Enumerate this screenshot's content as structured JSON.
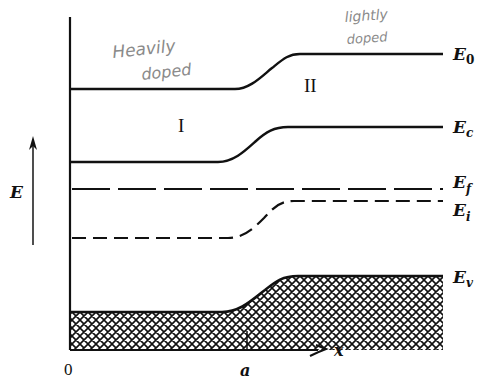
{
  "diagram": {
    "axis": {
      "y_label": "E",
      "x_label": "x",
      "origin_label": "0",
      "x_tick_label": "a"
    },
    "regions": {
      "left": "I",
      "right": "II"
    },
    "annotations": {
      "left_line1": "Heavily",
      "left_line2": "doped",
      "right_line1": "lightly",
      "right_line2": "doped"
    },
    "levels": [
      {
        "id": "E0",
        "symbol": "E",
        "sub": "0",
        "style": "solid",
        "left_y": 89,
        "right_y": 54
      },
      {
        "id": "Ec",
        "symbol": "E",
        "sub": "c",
        "style": "solid",
        "left_y": 162,
        "right_y": 127
      },
      {
        "id": "Ef",
        "symbol": "E",
        "sub": "f",
        "style": "long-dash",
        "left_y": 189,
        "right_y": 189
      },
      {
        "id": "Ei",
        "symbol": "E",
        "sub": "i",
        "style": "short-dash",
        "left_y": 238,
        "right_y": 201
      },
      {
        "id": "Ev",
        "symbol": "E",
        "sub": "v",
        "style": "solid-hatched-below",
        "left_y": 312,
        "right_y": 276
      }
    ],
    "colors": {
      "ink": "#111111",
      "annotation_pencil": "#8a8a8a",
      "background": "#ffffff"
    }
  }
}
